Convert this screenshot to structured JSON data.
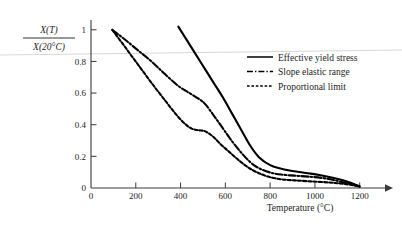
{
  "chart_data": {
    "type": "line",
    "title": "",
    "xlabel": "Temperature (°C)",
    "ylabel_numerator": "X(T)",
    "ylabel_denominator": "X(20°C)",
    "xlim": [
      0,
      1280
    ],
    "ylim": [
      0,
      1.06
    ],
    "grid": false,
    "legend_position": "right",
    "xticks": [
      0,
      200,
      400,
      600,
      800,
      1000,
      1200
    ],
    "xtick_labels": [
      "0",
      "200",
      "400",
      "600",
      "800",
      "1000",
      "1200"
    ],
    "yticks": [
      0,
      0.2,
      0.4,
      0.6,
      0.8,
      1
    ],
    "ytick_labels": [
      "0",
      "0.2",
      "0.4",
      "0.6",
      "0.8",
      "1"
    ],
    "series": [
      {
        "name": "Effective yield stress",
        "style": "solid",
        "color": "#000000",
        "x": [
          390,
          430,
          470,
          510,
          550,
          590,
          630,
          670,
          710,
          750,
          800,
          850,
          900,
          960,
          1020,
          1080,
          1140,
          1200
        ],
        "y": [
          1.02,
          0.93,
          0.84,
          0.75,
          0.66,
          0.57,
          0.47,
          0.37,
          0.27,
          0.195,
          0.145,
          0.122,
          0.108,
          0.095,
          0.082,
          0.065,
          0.042,
          0.01
        ]
      },
      {
        "name": "Slope elastic range",
        "style": "dashdot",
        "color": "#000000",
        "x": [
          95,
          150,
          210,
          270,
          330,
          390,
          440,
          480,
          510,
          550,
          590,
          630,
          670,
          710,
          750,
          800,
          850,
          910,
          970,
          1040,
          1110,
          1200
        ],
        "y": [
          1.0,
          0.94,
          0.87,
          0.8,
          0.72,
          0.645,
          0.6,
          0.565,
          0.53,
          0.455,
          0.375,
          0.295,
          0.225,
          0.165,
          0.125,
          0.098,
          0.085,
          0.078,
          0.072,
          0.062,
          0.042,
          0.01
        ]
      },
      {
        "name": "Proportional limit",
        "style": "dotted",
        "color": "#000000",
        "x": [
          95,
          150,
          210,
          270,
          330,
          380,
          420,
          450,
          480,
          510,
          545,
          580,
          620,
          660,
          700,
          740,
          790,
          850,
          910,
          980,
          1060,
          1130,
          1200
        ],
        "y": [
          1.0,
          0.895,
          0.78,
          0.665,
          0.555,
          0.465,
          0.405,
          0.375,
          0.365,
          0.358,
          0.325,
          0.275,
          0.225,
          0.175,
          0.132,
          0.1,
          0.072,
          0.055,
          0.048,
          0.042,
          0.035,
          0.026,
          0.01
        ]
      }
    ]
  },
  "axes": {
    "x_title": "Temperature (°C)",
    "y_title_top": "X(T)",
    "y_title_bottom": "X(20°C)"
  },
  "legend": {
    "entries": [
      {
        "label": "Effective yield stress",
        "style": "solid"
      },
      {
        "label": "Slope elastic range",
        "style": "dashdot"
      },
      {
        "label": "Proportional limit",
        "style": "dotted"
      }
    ]
  }
}
